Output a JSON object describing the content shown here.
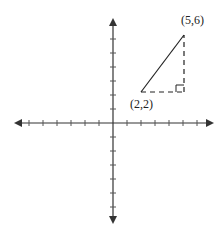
{
  "diagram": {
    "type": "coordinate-plane",
    "points": [
      {
        "label": "(2,2)",
        "x": 2,
        "y": 2
      },
      {
        "label": "(5,6)",
        "x": 5,
        "y": 6
      }
    ],
    "segments": [
      {
        "from": "(2,2)",
        "to": "(5,6)",
        "style": "solid"
      },
      {
        "from": "(2,2)",
        "to": "(5,2)",
        "style": "dashed"
      },
      {
        "from": "(5,2)",
        "to": "(5,6)",
        "style": "dashed"
      }
    ],
    "right_angle_marker_at": "(5,2)",
    "axis_color": "#333333",
    "line_color": "#222222"
  }
}
